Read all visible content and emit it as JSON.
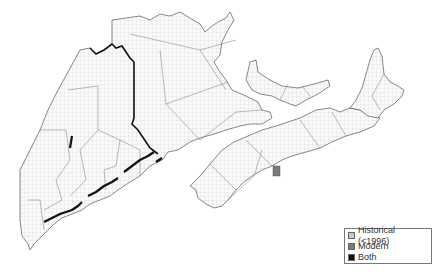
{
  "map": {
    "regions": [
      "Maine",
      "New Brunswick",
      "Prince Edward Island",
      "Nova Scotia",
      "Cape Breton Island"
    ],
    "highlighted_cell": {
      "category": "Modern",
      "location": "Nova Scotia south shore"
    }
  },
  "legend": {
    "items": [
      {
        "label": "Historical (<1996)",
        "color": "#c8c8c8"
      },
      {
        "label": "Modern",
        "color": "#7a7a7a"
      },
      {
        "label": "Both",
        "color": "#111111"
      }
    ]
  }
}
